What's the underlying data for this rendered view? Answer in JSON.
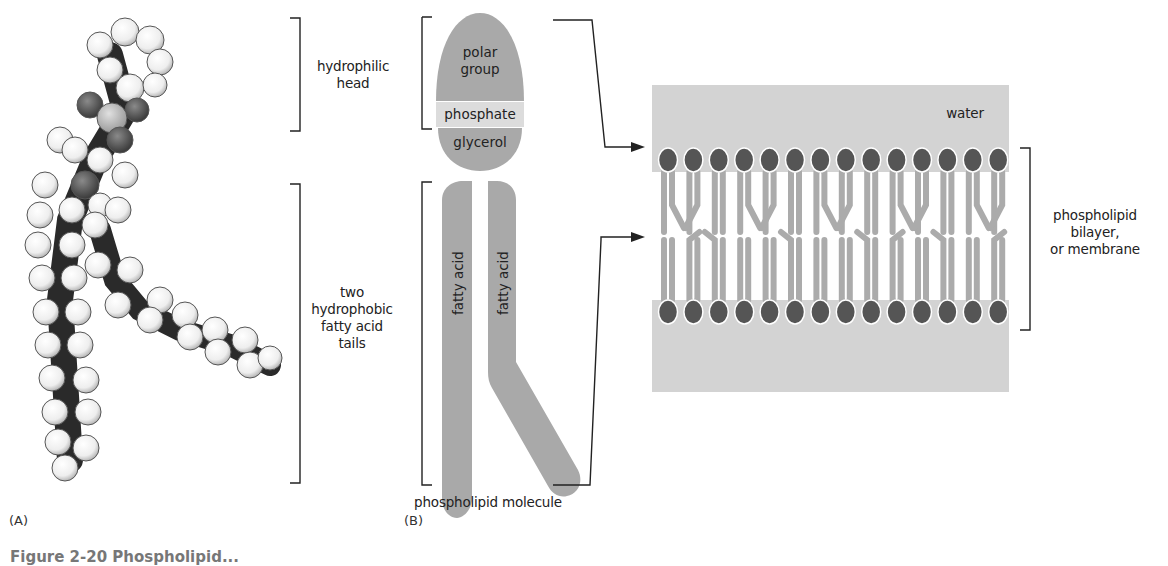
{
  "figure": {
    "caption_fragment": "Figure 2-20 Phospholipid...",
    "colors": {
      "shape_gray": "#a9a9a9",
      "light_gray": "#dcdcdc",
      "water": "#d3d3d3",
      "head_dark": "#555555",
      "tail_gray": "#ababab",
      "line": "#222222"
    }
  },
  "panel_a": {
    "tag": "(A)",
    "model": "space-filling-model",
    "labels": {
      "head_bracket": "hydrophilic\nhead",
      "tail_bracket": "two\nhydrophobic\nfatty acid\ntails"
    }
  },
  "panel_b": {
    "tag": "(B)",
    "molecule_parts": {
      "polar_group": "polar\ngroup",
      "phosphate": "phosphate",
      "glycerol": "glycerol",
      "fatty_acid_1": "fatty acid",
      "fatty_acid_2": "fatty acid"
    },
    "molecule_label": "phospholipid molecule"
  },
  "bilayer": {
    "water_label": "water",
    "bracket_label": "phospholipid\nbilayer,\nor membrane",
    "heads_per_row": 14
  }
}
